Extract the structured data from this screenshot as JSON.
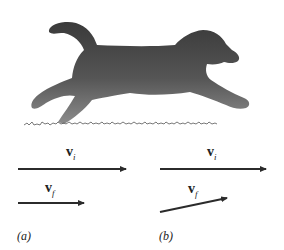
{
  "figure": {
    "illustration": "running-puppy-silhouette",
    "colors": {
      "silhouette_dark": "#3c3c3c",
      "silhouette_light": "#8a8a8a",
      "grass": "#555555",
      "arrow": "#2b2b2b",
      "text": "#222222"
    },
    "panels": [
      {
        "id": "a",
        "label": "(a)",
        "vectors": [
          {
            "symbol": "v",
            "subscript": "i",
            "direction": "horizontal-right",
            "relative_length": 1.0
          },
          {
            "symbol": "v",
            "subscript": "f",
            "direction": "horizontal-right",
            "relative_length": 0.62
          }
        ]
      },
      {
        "id": "b",
        "label": "(b)",
        "vectors": [
          {
            "symbol": "v",
            "subscript": "i",
            "direction": "horizontal-right",
            "relative_length": 1.0
          },
          {
            "symbol": "v",
            "subscript": "f",
            "direction": "up-right (angled ~12°)",
            "relative_length": 0.65
          }
        ]
      }
    ]
  }
}
